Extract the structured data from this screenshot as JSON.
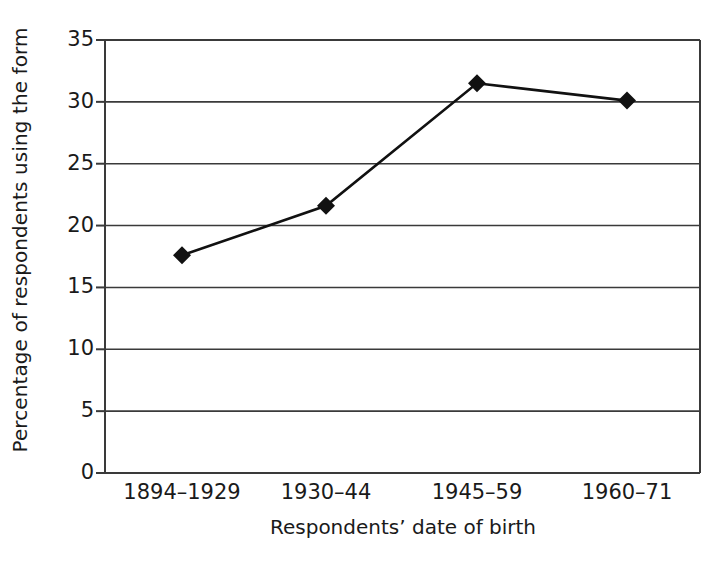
{
  "chart_data": {
    "type": "line",
    "title": "",
    "xlabel": "Respondents’ date of birth",
    "ylabel": "Percentage of respondents using the form",
    "categories": [
      "1894–1929",
      "1930–44",
      "1945–59",
      "1960–71"
    ],
    "values": [
      17.6,
      21.6,
      31.5,
      30.1
    ],
    "series": [
      {
        "name": "Percentage of respondents using the form",
        "values": [
          17.6,
          21.6,
          31.5,
          30.1
        ]
      }
    ],
    "ylim": [
      0,
      35
    ],
    "yticks": [
      0,
      5,
      10,
      15,
      20,
      25,
      30,
      35
    ],
    "ytick_labels": [
      "0",
      "5",
      "10",
      "15",
      "20",
      "25",
      "30",
      "35"
    ],
    "grid": "horizontal",
    "legend": "none",
    "marker": "diamond",
    "line_color": "#111111",
    "marker_color": "#111111",
    "axis_color": "#3a3a3a",
    "grid_color": "#3a3a3a",
    "background": "#ffffff"
  },
  "axes": {
    "y_title": "Percentage of respondents using the form",
    "x_title": "Respondents’ date of birth"
  }
}
